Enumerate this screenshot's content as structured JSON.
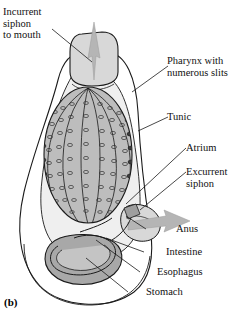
{
  "figure": {
    "panel_label": "(b)",
    "colors": {
      "outline": "#1a1a1a",
      "tunic_fill": "#ffffff",
      "siphon_fill": "#d8d8d8",
      "pharynx_fill": "#bdbdbd",
      "atrium_fill": "#efefef",
      "stomach_fill": "#a8a8a8",
      "intestine_fill": "#c4c4c4",
      "arrow_fill": "#b5b5b5",
      "slit_dark": "#2a2a2a"
    }
  },
  "labels": {
    "incurrent_siphon": "Incurrent\nsiphon\nto mouth",
    "pharynx": "Pharynx with\nnumerous slits",
    "tunic": "Tunic",
    "atrium": "Atrium",
    "excurrent_siphon": "Excurrent\nsiphon",
    "anus": "Anus",
    "intestine": "Intestine",
    "esophagus": "Esophagus",
    "stomach": "Stomach"
  }
}
